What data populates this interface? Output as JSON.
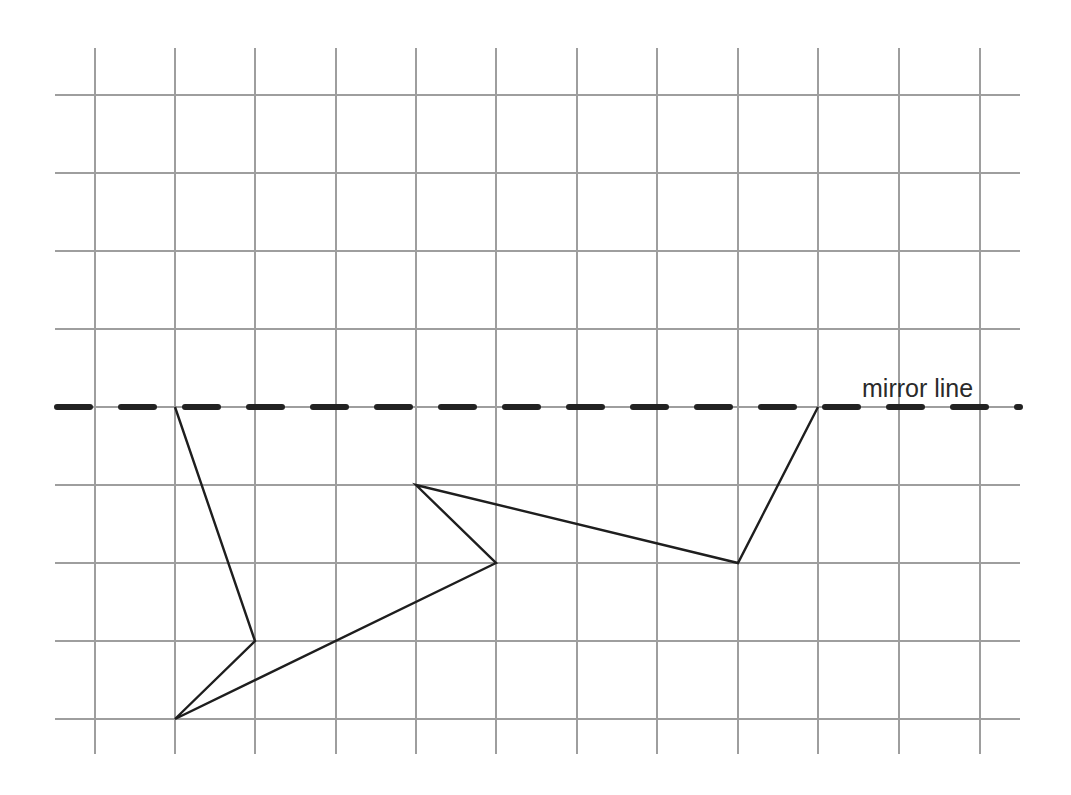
{
  "diagram": {
    "title": "",
    "mirror_line_label": "mirror line",
    "colors": {
      "grid": "#9e9e9e",
      "mirror_line": "#222222",
      "shape": "#1e1e1e",
      "label": "#2a2a2a"
    },
    "grid": {
      "vertical_x": [
        95,
        175,
        255,
        336,
        416,
        496,
        577,
        657,
        738,
        818,
        899,
        980
      ],
      "vertical_y_range": [
        48,
        754
      ],
      "horizontal_y": [
        95,
        173,
        251,
        329,
        407,
        485,
        563,
        641,
        719
      ],
      "horizontal_x_range": [
        55,
        1020
      ],
      "columns": 12,
      "rows": 9
    },
    "mirror_line": {
      "y": 407,
      "x_start": 57,
      "x_end": 1020,
      "style": "dashed"
    },
    "shape": {
      "type": "open-polyline",
      "grid_points": [
        [
          1,
          4
        ],
        [
          2,
          7
        ],
        [
          1,
          8
        ],
        [
          5,
          6
        ],
        [
          4,
          5
        ],
        [
          8,
          6
        ],
        [
          9,
          4
        ]
      ],
      "pixel_points": [
        [
          175,
          407
        ],
        [
          255,
          641
        ],
        [
          175,
          719
        ],
        [
          496,
          563
        ],
        [
          416,
          485
        ],
        [
          738,
          563
        ],
        [
          818,
          407
        ]
      ]
    },
    "label_position": {
      "x": 862,
      "y": 397
    }
  }
}
